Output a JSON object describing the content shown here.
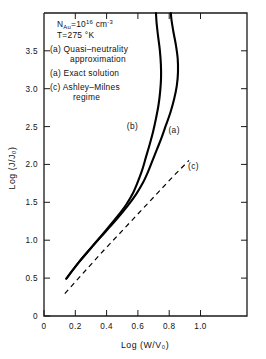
{
  "chart_data": {
    "type": "line",
    "title": "",
    "xlabel": "Log (W/V₀)",
    "ylabel": "Log (J/J₀)",
    "xlim": [
      -0.075,
      1.29
    ],
    "ylim": [
      0,
      4.05
    ],
    "xticks": [
      0,
      0.2,
      0.4,
      0.6,
      0.8,
      1.0
    ],
    "xticklabels": [
      "0",
      "0.2",
      "0.4",
      "0.6",
      "0.8",
      "1.0"
    ],
    "yticks": [
      0,
      0.5,
      1.0,
      1.5,
      2.0,
      2.5,
      3.0,
      3.5
    ],
    "yticklabels": [
      "0",
      "0.5",
      "1.0",
      "1.5",
      "2.0",
      "2.5",
      "3.0",
      "3.5"
    ],
    "grid": false,
    "legend_position": "upper-left-inside",
    "series": [
      {
        "name": "(a) Quasi-neutrality approximation",
        "label": "(a)",
        "style": "solid",
        "points": [
          [
            0.075,
            0.5
          ],
          [
            0.16,
            0.72
          ],
          [
            0.25,
            0.93
          ],
          [
            0.34,
            1.13
          ],
          [
            0.42,
            1.31
          ],
          [
            0.49,
            1.48
          ],
          [
            0.545,
            1.63
          ],
          [
            0.59,
            1.78
          ],
          [
            0.625,
            1.93
          ],
          [
            0.655,
            2.08
          ],
          [
            0.685,
            2.23
          ],
          [
            0.715,
            2.38
          ],
          [
            0.745,
            2.55
          ],
          [
            0.775,
            2.72
          ],
          [
            0.8,
            2.9
          ],
          [
            0.818,
            3.08
          ],
          [
            0.826,
            3.26
          ],
          [
            0.824,
            3.44
          ],
          [
            0.812,
            3.62
          ],
          [
            0.795,
            3.8
          ],
          [
            0.782,
            3.96
          ],
          [
            0.778,
            4.05
          ]
        ]
      },
      {
        "name": "(a) Exact solution",
        "label": "(b)",
        "style": "solid",
        "points": [
          [
            0.075,
            0.5
          ],
          [
            0.16,
            0.72
          ],
          [
            0.25,
            0.93
          ],
          [
            0.335,
            1.13
          ],
          [
            0.41,
            1.31
          ],
          [
            0.475,
            1.48
          ],
          [
            0.52,
            1.63
          ],
          [
            0.555,
            1.79
          ],
          [
            0.585,
            1.95
          ],
          [
            0.61,
            2.12
          ],
          [
            0.635,
            2.29
          ],
          [
            0.658,
            2.46
          ],
          [
            0.678,
            2.64
          ],
          [
            0.695,
            2.82
          ],
          [
            0.706,
            3.0
          ],
          [
            0.712,
            3.18
          ],
          [
            0.711,
            3.36
          ],
          [
            0.704,
            3.55
          ],
          [
            0.692,
            3.74
          ],
          [
            0.682,
            3.92
          ],
          [
            0.678,
            4.05
          ]
        ]
      },
      {
        "name": "(c) Ashley-Milnes regime",
        "label": "(c)",
        "style": "dashed",
        "points": [
          [
            0.065,
            0.3
          ],
          [
            0.3,
            0.82
          ],
          [
            0.55,
            1.35
          ],
          [
            0.8,
            1.88
          ],
          [
            0.9,
            2.08
          ]
        ]
      }
    ],
    "annotations": {
      "conditions": [
        {
          "id": "doping",
          "text_prefix": "N",
          "text_sub": "Au",
          "text_mid": "=10",
          "text_sup": "16",
          "text_suffix": " cm",
          "text_sup2": "-3"
        },
        {
          "id": "temperature",
          "text": "T=275 °K"
        }
      ],
      "legend_entries": [
        {
          "key": "(a)",
          "line1": "(a) Quasi–neutrality",
          "line2": "approximation"
        },
        {
          "key": "(a)",
          "line1": "(a) Exact solution",
          "line2": ""
        },
        {
          "key": "(c)",
          "line1": "(c) Ashley–Milnes",
          "line2": "regime"
        }
      ],
      "curve_labels": [
        {
          "label": "(b)",
          "x": 0.52,
          "y": 2.5
        },
        {
          "label": "(a)",
          "x": 0.8,
          "y": 2.45
        },
        {
          "label": "(c)",
          "x": 0.93,
          "y": 1.97
        }
      ]
    },
    "colors": {
      "axis": "#1a1a1a",
      "curve": "#000000",
      "background": "#ffffff",
      "text": "#111111"
    }
  }
}
